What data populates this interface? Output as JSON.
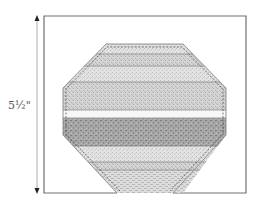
{
  "diagram": {
    "type": "quilt-block-template",
    "shape": "octagon",
    "dimension_label": "5½\"",
    "dimension_orientation": "vertical",
    "colors": {
      "frame": "#707070",
      "outline": "#8a8a8a",
      "stitch": "#555555",
      "strip_light": "#e4e4e4",
      "strip_mid": "#d0d0d0",
      "strip_white": "#f8f8f8",
      "strip_dark": "#a8a8a8",
      "strip_weave": "#dadada"
    },
    "strips": [
      {
        "name": "strip-1",
        "tone": "light"
      },
      {
        "name": "strip-2",
        "tone": "mid"
      },
      {
        "name": "strip-3",
        "tone": "light"
      },
      {
        "name": "strip-4",
        "tone": "mid"
      },
      {
        "name": "strip-5",
        "tone": "white"
      },
      {
        "name": "strip-6",
        "tone": "dark"
      },
      {
        "name": "strip-7",
        "tone": "light"
      },
      {
        "name": "strip-8",
        "tone": "mid"
      },
      {
        "name": "strip-9",
        "tone": "weave"
      }
    ]
  }
}
